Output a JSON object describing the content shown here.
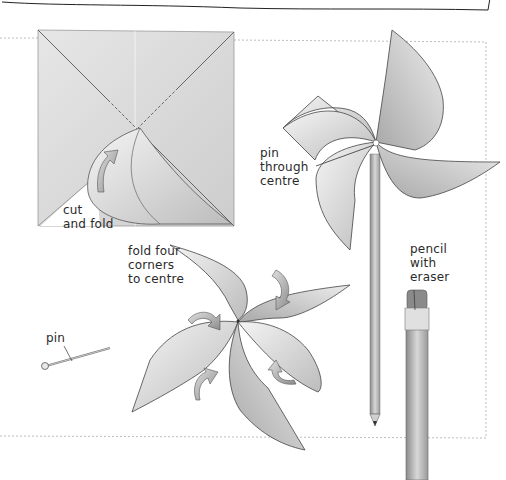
{
  "figure": {
    "steps": [
      {
        "id": "step-cut",
        "label": "cut\nand fold"
      },
      {
        "id": "step-fold",
        "label": "fold four\ncorners\nto centre"
      }
    ],
    "parts": [
      {
        "id": "pin",
        "label": "pin"
      },
      {
        "id": "pin-center",
        "label": "pin\nthrough\ncentre"
      },
      {
        "id": "pencil",
        "label": "pencil\nwith\neraser"
      }
    ]
  },
  "colors": {
    "paper_light": "#f2f2f2",
    "paper_mid": "#cfcfcf",
    "paper_dark": "#9a9a9a",
    "outline": "#333333",
    "border_dashed": "#b8b8b8",
    "text": "#2a2a2a"
  }
}
